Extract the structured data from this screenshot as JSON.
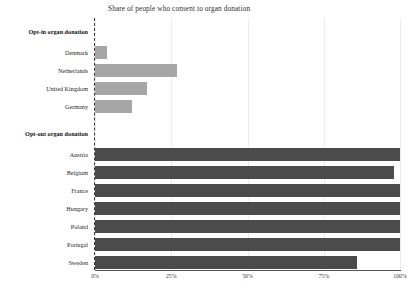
{
  "chart_data": {
    "type": "bar",
    "orientation": "horizontal",
    "title": "Share of people who consent to organ donation",
    "xlabel": "",
    "ylabel": "",
    "xlim": [
      0,
      100
    ],
    "xticks": [
      "0%",
      "25%",
      "50%",
      "75%",
      "100%"
    ],
    "xtick_values": [
      0,
      25,
      50,
      75,
      100
    ],
    "grid": true,
    "legend": "none",
    "colors": {
      "opt_in": "#a6a6a6",
      "opt_out": "#4b4b4b",
      "gridline": "#ececec",
      "zero_line": "#3a3a3a",
      "axis": "#555555",
      "background": "#ffffff",
      "text": "#1f1f1f"
    },
    "groups": [
      {
        "label": "Opt-in organ donation",
        "style": "opt_in",
        "categories": [
          "Denmark",
          "Netherlands",
          "United Kingdom",
          "Germany"
        ],
        "values": [
          4,
          27,
          17,
          12
        ]
      },
      {
        "label": "Opt-out organ donation",
        "style": "opt_out",
        "categories": [
          "Austria",
          "Belgium",
          "France",
          "Hungary",
          "Poland",
          "Portugal",
          "Sweden"
        ],
        "values": [
          100,
          98,
          100,
          100,
          100,
          100,
          86
        ]
      }
    ]
  }
}
